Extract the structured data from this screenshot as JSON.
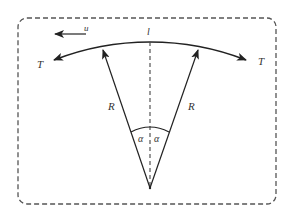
{
  "diagram": {
    "type": "free-body diagram of a curved string/membrane element",
    "labels": {
      "velocity": "u",
      "length": "l",
      "tension_left": "T",
      "tension_right": "T",
      "radius_left": "R",
      "radius_right": "R",
      "angle_left": "α",
      "angle_right": "α"
    },
    "colors": {
      "stroke": "#222222",
      "dashed_border": "#555555",
      "text": "#333333",
      "background": "#ffffff"
    }
  }
}
